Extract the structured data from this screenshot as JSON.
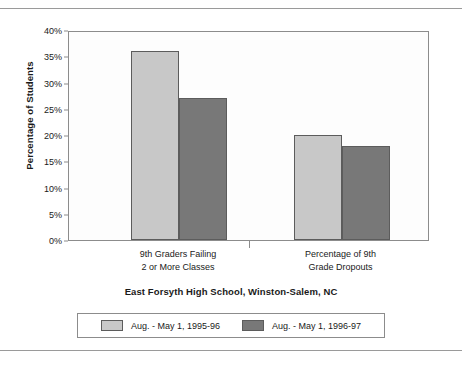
{
  "chart_data": {
    "type": "bar",
    "title": "East Forsyth High School, Winston-Salem, NC",
    "xlabel": "",
    "ylabel": "Percentage of Students",
    "ylim": [
      0,
      40
    ],
    "ytick_labels": [
      "0%",
      "5%",
      "10%",
      "15%",
      "20%",
      "25%",
      "30%",
      "35%",
      "40%"
    ],
    "ytick_values": [
      0,
      5,
      10,
      15,
      20,
      25,
      30,
      35,
      40
    ],
    "grid": false,
    "legend_position": "bottom",
    "categories": [
      "9th Graders Failing\n2 or More Classes",
      "Percentage of 9th\nGrade Dropouts"
    ],
    "category_lines": [
      [
        "9th Graders Failing",
        "2 or More Classes"
      ],
      [
        "Percentage of 9th",
        "Grade Dropouts"
      ]
    ],
    "series": [
      {
        "name": "Aug. - May 1, 1995-96",
        "color": "#c8c8c8",
        "values": [
          36,
          20
        ]
      },
      {
        "name": "Aug. - May 1, 1996-97",
        "color": "#787878",
        "values": [
          27,
          18
        ]
      }
    ]
  },
  "legend": {
    "items": [
      {
        "label": "Aug. - May 1, 1995-96"
      },
      {
        "label": "Aug. - May 1, 1996-97"
      }
    ]
  }
}
